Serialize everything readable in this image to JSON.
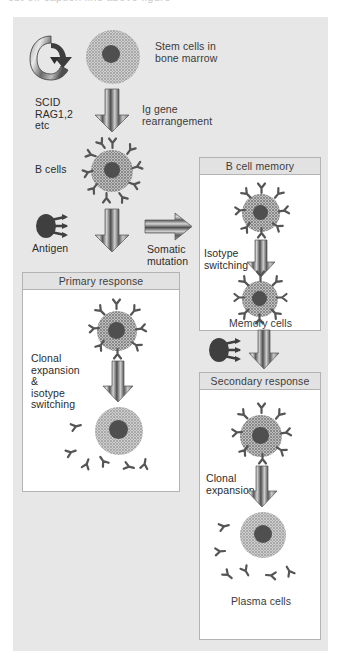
{
  "caption": {
    "text": "cut-off caption line above figure"
  },
  "figure": {
    "title_hidden": "",
    "labels": {
      "stem_cells": "Stem cells in\nbone marrow",
      "scid": "SCID\nRAG1,2\netc",
      "ig_rearrangement": "Ig gene\nrearrangement",
      "b_cells": "B cells",
      "antigen": "Antigen",
      "somatic_mutation": "Somatic\nmutation",
      "memory_cells": "Memory cells",
      "isotype_switching": "Isotype\nswitching",
      "clonal_expansion_isotype": "Clonal\nexpansion\n&\nisotype\nswitching",
      "clonal_expansion": "Clonal\nexpansion",
      "plasma_cells": "Plasma cells"
    },
    "boxes": {
      "b_cell_memory": "B cell memory",
      "primary_response": "Primary response",
      "secondary_response": "Secondary response"
    },
    "colors": {
      "panel_bg": "#e7e7e7",
      "box_bg": "#ffffff",
      "box_header_bg": "#e2e2e2",
      "box_border": "#b3b3b3",
      "nucleus": "#4f4f4f",
      "antibody": "#555555",
      "arrow_stripe_dark": "#4a4a4a",
      "arrow_stripe_light": "#c8c8c8",
      "text": "#3a3a3a"
    }
  }
}
